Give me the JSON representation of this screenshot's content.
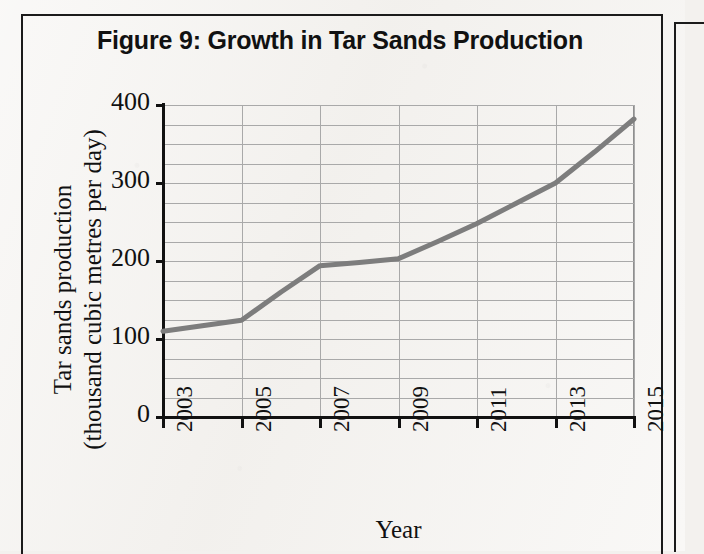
{
  "figure": {
    "title": "Figure 9: Growth in Tar Sands Production",
    "frame_color": "#1b1b1b",
    "page_background": "#f3f1ee"
  },
  "axes": {
    "y_title_line1": "Tar sands production",
    "y_title_line2": "(thousand cubic metres per day)",
    "x_title": "Year",
    "y_ticks": [
      "400",
      "300",
      "200",
      "100",
      "0"
    ],
    "x_ticks": [
      "2003",
      "2005",
      "2007",
      "2009",
      "2011",
      "2013",
      "2015"
    ]
  },
  "chart_data": {
    "type": "line",
    "title": "Figure 9: Growth in Tar Sands Production",
    "xlabel": "Year",
    "ylabel": "Tar sands production (thousand cubic metres per day)",
    "x": [
      2003,
      2004,
      2005,
      2006,
      2007,
      2008,
      2009,
      2010,
      2011,
      2012,
      2013,
      2014,
      2015
    ],
    "values": [
      110,
      117,
      124,
      160,
      194,
      198,
      203,
      225,
      248,
      274,
      300,
      340,
      382
    ],
    "xlim": [
      2003,
      2015
    ],
    "ylim": [
      0,
      400
    ],
    "y_major_ticks": [
      0,
      100,
      200,
      300,
      400
    ],
    "y_minor_step": 25,
    "x_tick_step": 2,
    "grid": true,
    "legend": "none",
    "series_color": "#7d7d7d",
    "gridline_color": "#a9a9a9"
  }
}
